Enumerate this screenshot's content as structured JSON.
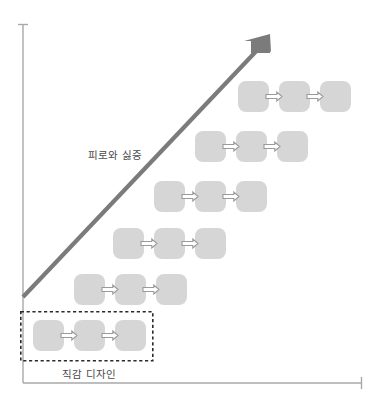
{
  "chart_data": {
    "type": "diagram",
    "title": "",
    "xlabel": "",
    "ylabel": "",
    "grid": false,
    "legend": "none",
    "axes": {
      "y_axis": {
        "x": 23,
        "y_top": 24,
        "y_bottom": 383,
        "arrow": "up-tick"
      },
      "x_axis": {
        "y": 383,
        "x_left": 23,
        "x_right": 362,
        "arrow": "right-tick"
      }
    },
    "trend": {
      "label": "피로와 싫증",
      "color": "#7b7b7b",
      "start": [
        23,
        297
      ],
      "end": [
        268,
        38
      ],
      "arrowhead": "end"
    },
    "highlight_group": {
      "label": "직감 디자인",
      "style": "dashed",
      "color": "#2b2b2b",
      "x": 20,
      "y": 311,
      "width": 133,
      "height": 50
    },
    "node_color": "#d6d6d6",
    "arrow_fill": "#ffffff",
    "arrow_stroke": "#9a9a9a",
    "box_size": 31,
    "box_radius": 8,
    "rows": [
      {
        "index": 1,
        "x": 238,
        "y": 81,
        "step": 41,
        "boxes": 3,
        "arrows": 2
      },
      {
        "index": 2,
        "x": 195,
        "y": 131,
        "step": 41,
        "boxes": 3,
        "arrows": 2
      },
      {
        "index": 3,
        "x": 154,
        "y": 181,
        "step": 41,
        "boxes": 3,
        "arrows": 2
      },
      {
        "index": 4,
        "x": 113,
        "y": 228,
        "step": 41,
        "boxes": 3,
        "arrows": 2
      },
      {
        "index": 5,
        "x": 74,
        "y": 274,
        "step": 41,
        "boxes": 3,
        "arrows": 2
      },
      {
        "index": 6,
        "x": 33,
        "y": 320,
        "step": 41,
        "boxes": 3,
        "arrows": 2
      }
    ]
  },
  "labels": {
    "trend": "피로와 싫증",
    "group": "직감 디자인"
  },
  "icons": {
    "flow_arrow": "arrow-right-outline",
    "trend_arrow": "arrow-up-right",
    "axis_tick": "axis-tick"
  }
}
